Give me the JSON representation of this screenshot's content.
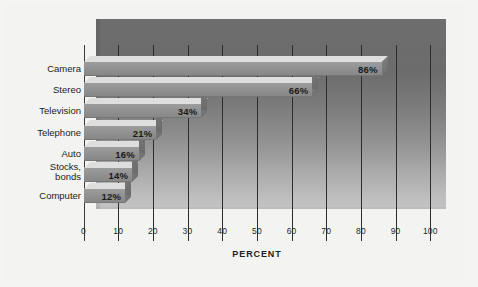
{
  "chart_data": {
    "type": "bar",
    "orientation": "horizontal",
    "style": "3d-staircase",
    "title": "",
    "subtitle": "",
    "xlabel": "PERCENT",
    "ylabel": "",
    "categories": [
      "Camera",
      "Stereo",
      "Television",
      "Telephone",
      "Auto",
      "Stocks,\nbonds",
      "Computer"
    ],
    "values": [
      86,
      66,
      34,
      21,
      16,
      14,
      12
    ],
    "data_labels": [
      "86%",
      "66%",
      "34%",
      "21%",
      "16%",
      "14%",
      "12%"
    ],
    "xlim": [
      0,
      100
    ],
    "xticks": [
      0,
      10,
      20,
      30,
      40,
      50,
      60,
      70,
      80,
      90,
      100
    ],
    "xtick_labels": [
      "0",
      "10",
      "20",
      "30",
      "40",
      "50",
      "60",
      "70",
      "80",
      "90",
      "100"
    ],
    "grid": true,
    "grid_orientation": "vertical",
    "legend": false,
    "legend_position": "none",
    "colors": {
      "bar_face": "#949494",
      "bar_top": "#dedede",
      "bar_cap": "#767676",
      "backdrop_dark": "#6e6e6e",
      "backdrop_light": "#bdbdbd",
      "gridline": "#2d2d2d",
      "text": "#1b1b1b",
      "page": "#f3f3f1"
    }
  },
  "axis": {
    "title": "PERCENT",
    "ticks": [
      {
        "value": 0,
        "label": "0"
      },
      {
        "value": 10,
        "label": "10"
      },
      {
        "value": 20,
        "label": "20"
      },
      {
        "value": 30,
        "label": "30"
      },
      {
        "value": 40,
        "label": "40"
      },
      {
        "value": 50,
        "label": "50"
      },
      {
        "value": 60,
        "label": "60"
      },
      {
        "value": 70,
        "label": "70"
      },
      {
        "value": 80,
        "label": "80"
      },
      {
        "value": 90,
        "label": "90"
      },
      {
        "value": 100,
        "label": "100"
      }
    ]
  },
  "bars": [
    {
      "category": "Camera",
      "value": 86,
      "label": "86%"
    },
    {
      "category": "Stereo",
      "value": 66,
      "label": "66%"
    },
    {
      "category": "Television",
      "value": 34,
      "label": "34%"
    },
    {
      "category": "Telephone",
      "value": 21,
      "label": "21%"
    },
    {
      "category": "Auto",
      "value": 16,
      "label": "16%"
    },
    {
      "category": "Stocks,\nbonds",
      "value": 14,
      "label": "14%"
    },
    {
      "category": "Computer",
      "value": 12,
      "label": "12%"
    }
  ]
}
